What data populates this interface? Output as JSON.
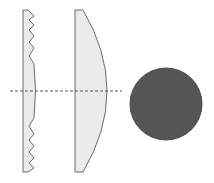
{
  "diagram": {
    "colors": {
      "lens_fill": "#ebebeb",
      "lens_stroke": "#6b6b6b",
      "sphere_fill": "#555555",
      "axis_line": "#555555",
      "background": "#ffffff"
    },
    "elements": [
      {
        "id": "fresnel-lens",
        "label": ""
      },
      {
        "id": "plano-convex-lens",
        "label": ""
      },
      {
        "id": "optical-axis",
        "label": ""
      },
      {
        "id": "sphere",
        "label": ""
      }
    ]
  }
}
